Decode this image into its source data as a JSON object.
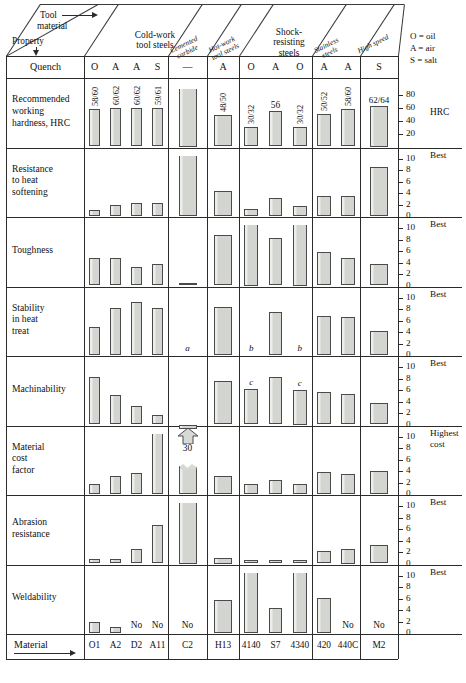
{
  "legend": {
    "lines": [
      "O = oil",
      "A = air",
      "S = salt"
    ]
  },
  "header": {
    "corner_top": "Tool",
    "corner_top2": "material",
    "corner_bottom": "Property",
    "quench_label": "Quench",
    "material_label": "Material",
    "groups": [
      {
        "name": "cold-work",
        "line1": "Cold-work",
        "line2": "tool steels",
        "italic": false
      },
      {
        "name": "cemented-carbide",
        "line1": "Cemented",
        "line2": "carbide",
        "italic": true
      },
      {
        "name": "hot-work",
        "line1": "Hot-work",
        "line2": "tool steels",
        "italic": true
      },
      {
        "name": "shock-resisting",
        "line1": "Shock-",
        "line2": "resisting",
        "line3": "steels",
        "italic": false
      },
      {
        "name": "stainless",
        "line1": "Stainless",
        "line2": "steels",
        "italic": true
      },
      {
        "name": "high-speed",
        "line1": "High speed",
        "line2": "",
        "italic": true
      }
    ]
  },
  "columns": [
    {
      "material": "O1",
      "quench": "O"
    },
    {
      "material": "A2",
      "quench": "A"
    },
    {
      "material": "D2",
      "quench": "A"
    },
    {
      "material": "A11",
      "quench": "S"
    },
    {
      "material": "C2",
      "quench": "—"
    },
    {
      "material": "H13",
      "quench": "A"
    },
    {
      "material": "4140",
      "quench": "O"
    },
    {
      "material": "S7",
      "quench": "A"
    },
    {
      "material": "4340",
      "quench": "O"
    },
    {
      "material": "420",
      "quench": "A"
    },
    {
      "material": "440C",
      "quench": "A"
    },
    {
      "material": "M2",
      "quench": "S"
    }
  ],
  "chart_data": {
    "type": "bar",
    "categories": [
      "O1",
      "A2",
      "D2",
      "A11",
      "C2",
      "H13",
      "4140",
      "S7",
      "4340",
      "420",
      "440C",
      "M2"
    ],
    "xlabel": "Material",
    "grid": false,
    "legend_position": "top-right",
    "rows": [
      {
        "name": "hardness",
        "label_lines": [
          "Recommended",
          "working",
          "hardness, HRC"
        ],
        "unit": "HRC",
        "best_label": "",
        "ylim": [
          0,
          90
        ],
        "ticks": [
          20,
          40,
          60,
          80
        ],
        "values": [
          59,
          61,
          61,
          60,
          90,
          49,
          31,
          56,
          31,
          51,
          59,
          63
        ],
        "value_labels": [
          "58/60",
          "60/62",
          "60/62",
          "59/61",
          "",
          "48/50",
          "30/32",
          "56",
          "30/32",
          "50/52",
          "58/60",
          "62/64"
        ],
        "clipped": [
          false,
          false,
          false,
          false,
          true,
          false,
          false,
          false,
          false,
          false,
          false,
          false
        ],
        "notes": []
      },
      {
        "name": "heat-softening",
        "label_lines": [
          "Resistance",
          "to heat",
          "softening"
        ],
        "unit": "",
        "best_label": "Best",
        "ylim": [
          0,
          10
        ],
        "ticks": [
          2,
          4,
          6,
          8,
          10
        ],
        "values": [
          1.1,
          2.0,
          2.3,
          2.3,
          10.5,
          4.4,
          1.3,
          3.1,
          1.7,
          3.4,
          3.5,
          8.6
        ],
        "value_labels": [
          "",
          "",
          "",
          "",
          "",
          "",
          "",
          "",
          "",
          "",
          "",
          ""
        ],
        "clipped": [
          false,
          false,
          false,
          false,
          true,
          false,
          false,
          false,
          false,
          false,
          false,
          false
        ],
        "notes": []
      },
      {
        "name": "toughness",
        "label_lines": [
          "Toughness"
        ],
        "unit": "",
        "best_label": "Best",
        "ylim": [
          0,
          10
        ],
        "ticks": [
          2,
          4,
          6,
          8,
          10
        ],
        "values": [
          4.7,
          4.7,
          3.2,
          3.7,
          0.35,
          8.8,
          10.5,
          8.2,
          10.5,
          5.8,
          4.7,
          3.7
        ],
        "value_labels": [
          "",
          "",
          "",
          "",
          "",
          "",
          "",
          "",
          "",
          "",
          "",
          ""
        ],
        "clipped": [
          false,
          false,
          false,
          false,
          false,
          false,
          true,
          false,
          true,
          false,
          false,
          false
        ],
        "notes": []
      },
      {
        "name": "stability-heat-treat",
        "label_lines": [
          "Stability",
          "in heat",
          "treat"
        ],
        "unit": "",
        "best_label": "Best",
        "ylim": [
          0,
          10
        ],
        "ticks": [
          2,
          4,
          6,
          8,
          10
        ],
        "values": [
          4.9,
          8.2,
          9.2,
          8.1,
          0,
          8.4,
          0,
          7.4,
          0,
          6.8,
          6.6,
          4.2
        ],
        "value_labels": [
          "",
          "",
          "",
          "",
          "",
          "",
          "",
          "",
          "",
          "",
          "",
          ""
        ],
        "clipped": [
          false,
          false,
          false,
          false,
          false,
          false,
          false,
          false,
          false,
          false,
          false,
          false
        ],
        "notes": [
          {
            "column": 4,
            "text": "a"
          },
          {
            "column": 6,
            "text": "b"
          },
          {
            "column": 8,
            "text": "b"
          }
        ]
      },
      {
        "name": "machinability",
        "label_lines": [
          "Machinability"
        ],
        "unit": "",
        "best_label": "Best",
        "ylim": [
          0,
          10
        ],
        "ticks": [
          2,
          4,
          6,
          8,
          10
        ],
        "values": [
          8.2,
          5.2,
          3.2,
          1.6,
          0,
          7.6,
          6.1,
          8.2,
          6.0,
          5.7,
          5.3,
          3.8
        ],
        "value_labels": [
          "",
          "",
          "",
          "",
          "",
          "",
          "",
          "",
          "",
          "",
          "",
          ""
        ],
        "clipped": [
          false,
          false,
          false,
          false,
          false,
          false,
          false,
          false,
          false,
          false,
          false,
          false
        ],
        "notes": [
          {
            "column": 6,
            "text": "c"
          },
          {
            "column": 8,
            "text": "c"
          }
        ]
      },
      {
        "name": "material-cost-factor",
        "label_lines": [
          "Material",
          "cost",
          "factor"
        ],
        "unit": "",
        "best_label": "Highest\ncost",
        "best_label_line1": "Highest",
        "best_label_line2": "cost",
        "ylim": [
          0,
          10
        ],
        "ticks": [
          2,
          4,
          6,
          8,
          10
        ],
        "values": [
          1.8,
          3.1,
          3.6,
          10.5,
          10.5,
          3.1,
          1.7,
          2.4,
          1.8,
          3.8,
          3.5,
          4.0
        ],
        "value_labels": [
          "",
          "",
          "",
          "",
          "30",
          "",
          "",
          "",
          "",
          "",
          "",
          ""
        ],
        "clipped": [
          false,
          false,
          false,
          true,
          true,
          false,
          false,
          false,
          false,
          false,
          false,
          false
        ],
        "broken_column": 4,
        "broken_value_label": "30",
        "notes": []
      },
      {
        "name": "abrasion-resistance",
        "label_lines": [
          "Abrasion",
          "resistance"
        ],
        "unit": "",
        "best_label": "Best",
        "ylim": [
          0,
          10
        ],
        "ticks": [
          2,
          4,
          6,
          8,
          10
        ],
        "values": [
          0.8,
          0.7,
          2.6,
          6.7,
          10.5,
          1.0,
          0.6,
          0.6,
          0.6,
          2.2,
          2.5,
          3.3
        ],
        "value_labels": [
          "",
          "",
          "",
          "",
          "",
          "",
          "",
          "",
          "",
          "",
          "",
          ""
        ],
        "clipped": [
          false,
          false,
          false,
          false,
          true,
          false,
          false,
          false,
          false,
          false,
          false,
          false
        ],
        "notes": []
      },
      {
        "name": "weldability",
        "label_lines": [
          "Weldability"
        ],
        "unit": "",
        "best_label": "Best",
        "ylim": [
          0,
          10
        ],
        "ticks": [
          2,
          4,
          6,
          8,
          10
        ],
        "values": [
          1.9,
          1.0,
          0,
          0,
          0,
          5.8,
          10.5,
          4.4,
          10.5,
          6.1,
          0,
          0
        ],
        "value_labels": [
          "",
          "",
          "No",
          "No",
          "No",
          "",
          "",
          "",
          "",
          "",
          "No",
          "No"
        ],
        "clipped": [
          false,
          false,
          false,
          false,
          false,
          false,
          true,
          false,
          true,
          false,
          false,
          false
        ],
        "notes": []
      }
    ]
  }
}
